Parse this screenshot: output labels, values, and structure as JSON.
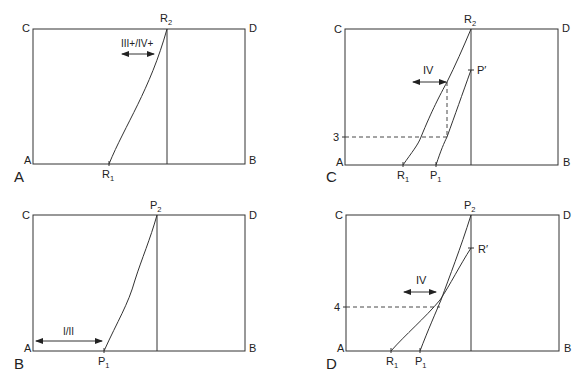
{
  "panels": [
    {
      "id": "A",
      "panel_label": "A",
      "corners": {
        "top_left": "C",
        "top_right": "D",
        "bottom_left": "A",
        "bottom_right": "B"
      },
      "points": [
        {
          "name": "R",
          "sub": "1",
          "role": "start"
        },
        {
          "name": "R",
          "sub": "2",
          "role": "end"
        }
      ],
      "arrow_label": "III+/IV+",
      "arrow_direction": "both"
    },
    {
      "id": "C",
      "panel_label": "C",
      "corners": {
        "top_left": "C",
        "top_right": "D",
        "bottom_left": "A",
        "bottom_right": "B"
      },
      "points": [
        {
          "name": "R",
          "sub": "1"
        },
        {
          "name": "P",
          "sub": "1"
        },
        {
          "name": "R",
          "sub": "2"
        },
        {
          "name": "P′",
          "sub": ""
        }
      ],
      "arrow_label": "IV",
      "level_label": "3"
    },
    {
      "id": "B",
      "panel_label": "B",
      "corners": {
        "top_left": "C",
        "top_right": "D",
        "bottom_left": "A",
        "bottom_right": "B"
      },
      "points": [
        {
          "name": "P",
          "sub": "1"
        },
        {
          "name": "P",
          "sub": "2"
        }
      ],
      "arrow_label": "I/II"
    },
    {
      "id": "D",
      "panel_label": "D",
      "corners": {
        "top_left": "C",
        "top_right": "D",
        "bottom_left": "A",
        "bottom_right": "B"
      },
      "points": [
        {
          "name": "R",
          "sub": "1"
        },
        {
          "name": "P",
          "sub": "1"
        },
        {
          "name": "P",
          "sub": "2"
        },
        {
          "name": "R′",
          "sub": ""
        }
      ],
      "arrow_label": "IV",
      "level_label": "4"
    }
  ]
}
